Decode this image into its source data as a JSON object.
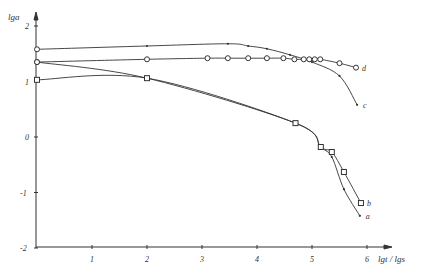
{
  "chart_data": {
    "type": "line",
    "title": "",
    "xlabel": "lgt / lgs",
    "ylabel": "lga",
    "xlim": [
      0,
      6.4
    ],
    "ylim": [
      -2,
      2.3
    ],
    "xticks": [
      "1",
      "2",
      "3",
      "4",
      "5",
      "6"
    ],
    "yticks": [
      "2",
      "1",
      "0",
      "-1",
      "-2"
    ],
    "grid": false,
    "series": [
      {
        "name": "a",
        "marker": "dot",
        "x": [
          0,
          2,
          4.7,
          5.16,
          5.36,
          5.58,
          5.87
        ],
        "y": [
          1.35,
          1.06,
          0.25,
          -0.18,
          -0.36,
          -0.94,
          -1.42
        ]
      },
      {
        "name": "b",
        "marker": "square",
        "x": [
          0,
          2,
          4.7,
          5.16,
          5.36,
          5.58,
          5.89
        ],
        "y": [
          1.03,
          1.06,
          0.25,
          -0.18,
          -0.27,
          -0.63,
          -1.19
        ]
      },
      {
        "name": "c",
        "marker": "dot",
        "x": [
          0,
          2,
          3.47,
          3.84,
          4.18,
          4.6,
          5.0,
          5.5,
          5.82
        ],
        "y": [
          1.58,
          1.64,
          1.68,
          1.64,
          1.59,
          1.48,
          1.35,
          1.1,
          0.58
        ]
      },
      {
        "name": "d",
        "marker": "circle",
        "x": [
          0,
          2,
          3.1,
          3.47,
          3.84,
          4.18,
          4.48,
          4.68,
          4.85,
          4.95,
          5.05,
          5.15,
          5.5,
          5.8
        ],
        "y": [
          1.35,
          1.4,
          1.42,
          1.42,
          1.42,
          1.42,
          1.42,
          1.4,
          1.4,
          1.4,
          1.4,
          1.4,
          1.33,
          1.25
        ]
      }
    ]
  }
}
